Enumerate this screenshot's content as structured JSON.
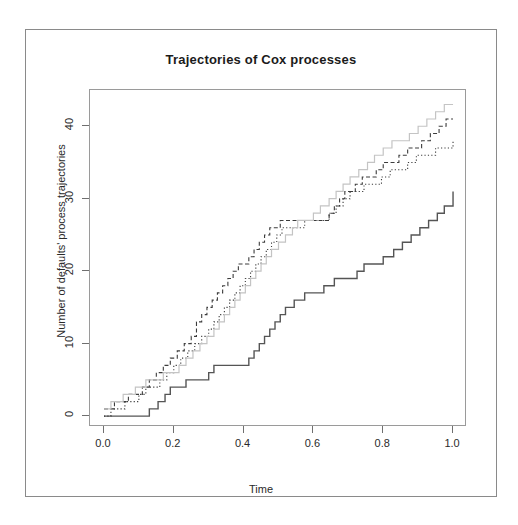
{
  "chart_data": {
    "type": "line",
    "title": "Trajectories of Cox processes",
    "xlabel": "Time",
    "ylabel": "Number of defaults' process trajectories",
    "xlim": [
      -0.04,
      1.04
    ],
    "ylim": [
      -1.5,
      45
    ],
    "xticks": [
      "0.0",
      "0.2",
      "0.4",
      "0.6",
      "0.8",
      "1.0"
    ],
    "xtick_values": [
      0.0,
      0.2,
      0.4,
      0.6,
      0.8,
      1.0
    ],
    "yticks": [
      "0",
      "10",
      "20",
      "30",
      "40"
    ],
    "ytick_values": [
      0,
      10,
      20,
      30,
      40
    ],
    "grid": false,
    "legend": "none",
    "step_shape": "hv",
    "series": [
      {
        "name": "trajectory-1",
        "style": "solid",
        "color": "#555555",
        "width": 1.4,
        "x": [
          0.0,
          0.02,
          0.05,
          0.09,
          0.12,
          0.13,
          0.155,
          0.175,
          0.19,
          0.21,
          0.235,
          0.255,
          0.275,
          0.3,
          0.315,
          0.335,
          0.355,
          0.375,
          0.395,
          0.415,
          0.43,
          0.445,
          0.46,
          0.475,
          0.49,
          0.505,
          0.52,
          0.545,
          0.575,
          0.6,
          0.63,
          0.66,
          0.7,
          0.725,
          0.745,
          0.775,
          0.8,
          0.83,
          0.855,
          0.88,
          0.905,
          0.93,
          0.955,
          0.975,
          1.0
        ],
        "y": [
          0,
          0,
          0,
          0,
          0,
          1,
          2,
          3,
          4,
          4,
          5,
          5,
          5,
          6,
          7,
          7,
          7,
          7,
          7,
          8,
          9,
          10,
          11,
          12,
          13,
          14,
          15,
          16,
          17,
          17,
          18,
          19,
          19,
          20,
          21,
          21,
          22,
          23,
          24,
          25,
          26,
          27,
          28,
          29,
          31
        ]
      },
      {
        "name": "trajectory-2",
        "style": "dashed",
        "color": "#3c3c3c",
        "width": 1.1,
        "x": [
          0.0,
          0.015,
          0.03,
          0.05,
          0.07,
          0.09,
          0.11,
          0.13,
          0.15,
          0.17,
          0.19,
          0.21,
          0.23,
          0.25,
          0.265,
          0.28,
          0.295,
          0.31,
          0.325,
          0.34,
          0.355,
          0.37,
          0.385,
          0.4,
          0.415,
          0.43,
          0.445,
          0.46,
          0.475,
          0.49,
          0.505,
          0.52,
          0.63,
          0.645,
          0.66,
          0.675,
          0.69,
          0.705,
          0.72,
          0.74,
          0.76,
          0.78,
          0.8,
          0.82,
          0.845,
          0.87,
          0.89,
          0.91,
          0.935,
          0.96,
          0.98,
          1.0
        ],
        "y": [
          1,
          1,
          2,
          2,
          3,
          3,
          4,
          5,
          6,
          7,
          8,
          9,
          10,
          11,
          13,
          14,
          15,
          16,
          17,
          18,
          19,
          20,
          21,
          21,
          22,
          23,
          24,
          25,
          26,
          26,
          27,
          27,
          27,
          28,
          29,
          30,
          31,
          31,
          32,
          33,
          33,
          34,
          35,
          35,
          36,
          37,
          37,
          38,
          39,
          40,
          41,
          41
        ]
      },
      {
        "name": "trajectory-3",
        "style": "dotted",
        "color": "#3c3c3c",
        "width": 1.1,
        "x": [
          0.0,
          0.02,
          0.04,
          0.06,
          0.08,
          0.1,
          0.12,
          0.14,
          0.16,
          0.18,
          0.2,
          0.22,
          0.24,
          0.26,
          0.28,
          0.3,
          0.315,
          0.33,
          0.345,
          0.36,
          0.375,
          0.39,
          0.405,
          0.42,
          0.435,
          0.45,
          0.465,
          0.48,
          0.495,
          0.51,
          0.525,
          0.545,
          0.575,
          0.6,
          0.625,
          0.645,
          0.665,
          0.685,
          0.705,
          0.725,
          0.745,
          0.77,
          0.795,
          0.82,
          0.845,
          0.87,
          0.895,
          0.92,
          0.95,
          0.975,
          1.0
        ],
        "y": [
          0,
          1,
          1,
          2,
          2,
          3,
          4,
          4,
          5,
          6,
          7,
          8,
          9,
          10,
          11,
          12,
          13,
          14,
          15,
          16,
          17,
          18,
          19,
          20,
          21,
          22,
          23,
          24,
          25,
          26,
          26,
          26,
          27,
          27,
          27,
          28,
          29,
          30,
          31,
          31,
          32,
          32,
          33,
          34,
          34,
          35,
          36,
          36,
          37,
          37,
          38
        ]
      },
      {
        "name": "trajectory-4",
        "style": "solid",
        "color": "#c4c4c4",
        "width": 1.2,
        "x": [
          0.0,
          0.02,
          0.04,
          0.055,
          0.07,
          0.09,
          0.105,
          0.12,
          0.135,
          0.15,
          0.17,
          0.19,
          0.215,
          0.235,
          0.255,
          0.275,
          0.295,
          0.315,
          0.33,
          0.345,
          0.36,
          0.375,
          0.39,
          0.405,
          0.42,
          0.435,
          0.45,
          0.465,
          0.48,
          0.5,
          0.52,
          0.54,
          0.555,
          0.575,
          0.6,
          0.62,
          0.645,
          0.665,
          0.685,
          0.705,
          0.73,
          0.755,
          0.775,
          0.8,
          0.825,
          0.85,
          0.875,
          0.9,
          0.925,
          0.95,
          0.975,
          1.0
        ],
        "y": [
          1,
          2,
          2,
          3,
          3,
          4,
          4,
          5,
          5,
          5,
          6,
          6,
          7,
          8,
          9,
          10,
          11,
          12,
          13,
          14,
          15,
          16,
          17,
          18,
          19,
          20,
          21,
          22,
          23,
          24,
          25,
          26,
          27,
          27,
          28,
          29,
          30,
          31,
          32,
          33,
          34,
          35,
          36,
          37,
          38,
          38,
          39,
          40,
          41,
          42,
          43,
          43
        ]
      }
    ]
  }
}
